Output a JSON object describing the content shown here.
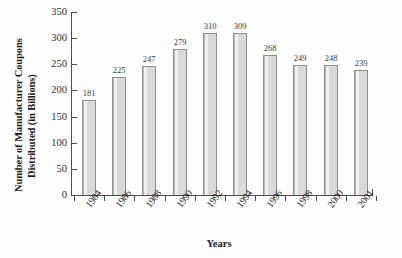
{
  "chart_data": {
    "type": "bar",
    "title": "",
    "xlabel": "Years",
    "ylabel_lines": [
      "Number of Manufacturer Coupons",
      "Distributed (in Billions)"
    ],
    "categories": [
      "1984",
      "1986",
      "1988",
      "1990",
      "1992",
      "1994",
      "1996",
      "1998",
      "2000",
      "2001"
    ],
    "values": [
      181,
      225,
      247,
      279,
      310,
      309,
      268,
      249,
      248,
      239
    ],
    "data_labels": [
      "181",
      "225",
      "247",
      "279",
      "310",
      "309",
      "268",
      "249",
      "248",
      "239"
    ],
    "ylim": [
      0,
      350
    ],
    "yticks": [
      0,
      50,
      100,
      150,
      200,
      250,
      300,
      350
    ],
    "ytick_labels": [
      "0",
      "50",
      "100",
      "150",
      "200",
      "250",
      "300",
      "350"
    ],
    "grid": false,
    "legend": false,
    "bar_fill_color": "#d9d9d9",
    "bar_edge_color": "#8e8e8e",
    "axis_color": "#4d4d4d",
    "background_color": "#fefefe"
  }
}
